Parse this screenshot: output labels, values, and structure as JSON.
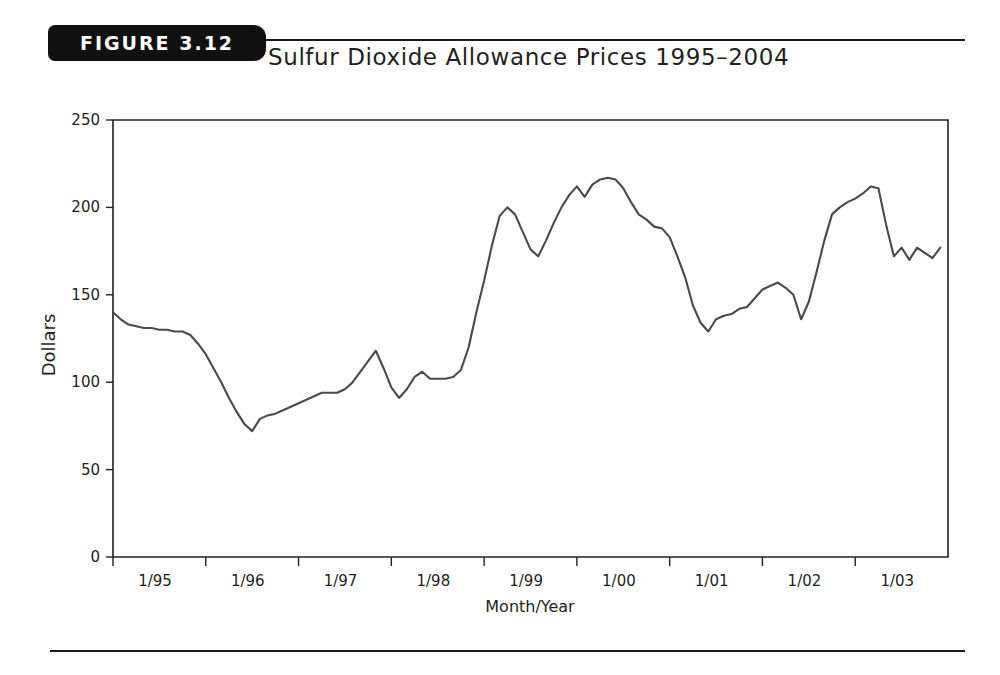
{
  "figure": {
    "badge_label": "FIGURE 3.12",
    "title": "Sulfur Dioxide Allowance Prices 1995–2004"
  },
  "colors": {
    "line": "#4a4a4a",
    "axis": "#231f20",
    "badge_background": "#111111",
    "badge_text": "#ffffff",
    "page_background": "#ffffff"
  },
  "chart_data": {
    "type": "line",
    "title": "Sulfur Dioxide Allowance Prices 1995–2004",
    "xlabel": "Month/Year",
    "ylabel": "Dollars",
    "xlim": [
      0,
      108
    ],
    "ylim": [
      0,
      250
    ],
    "grid": false,
    "legend": null,
    "yticks": [
      0,
      50,
      100,
      150,
      200,
      250
    ],
    "ytick_labels": [
      "0",
      "50",
      "100",
      "150",
      "200",
      "250"
    ],
    "xticks": [
      0,
      12,
      24,
      36,
      48,
      60,
      72,
      84,
      96
    ],
    "xtick_labels": [
      "1/95",
      "1/96",
      "1/97",
      "1/98",
      "1/99",
      "1/00",
      "1/01",
      "1/02",
      "1/03"
    ],
    "x": [
      0,
      1,
      2,
      3,
      4,
      5,
      6,
      7,
      8,
      9,
      10,
      11,
      12,
      13,
      14,
      15,
      16,
      17,
      18,
      19,
      20,
      21,
      22,
      23,
      24,
      25,
      26,
      27,
      28,
      29,
      30,
      31,
      32,
      33,
      34,
      35,
      36,
      37,
      38,
      39,
      40,
      41,
      42,
      43,
      44,
      45,
      46,
      47,
      48,
      49,
      50,
      51,
      52,
      53,
      54,
      55,
      56,
      57,
      58,
      59,
      60,
      61,
      62,
      63,
      64,
      65,
      66,
      67,
      68,
      69,
      70,
      71,
      72,
      73,
      74,
      75,
      76,
      77,
      78,
      79,
      80,
      81,
      82,
      83,
      84,
      85,
      86,
      87,
      88,
      89,
      90,
      91,
      92,
      93,
      94,
      95,
      96,
      97,
      98,
      99,
      100,
      101,
      102,
      103,
      104,
      105,
      106,
      107
    ],
    "values": [
      140,
      136,
      133,
      132,
      131,
      131,
      130,
      130,
      129,
      129,
      127,
      122,
      116,
      108,
      100,
      91,
      83,
      76,
      72,
      79,
      81,
      82,
      84,
      86,
      88,
      90,
      92,
      94,
      94,
      94,
      96,
      100,
      106,
      112,
      118,
      108,
      97,
      91,
      96,
      103,
      106,
      102,
      102,
      102,
      103,
      107,
      120,
      140,
      158,
      178,
      195,
      200,
      196,
      186,
      176,
      172,
      181,
      191,
      200,
      207,
      212,
      206,
      213,
      216,
      217,
      216,
      211,
      203,
      196,
      193,
      189,
      188,
      183,
      172,
      160,
      144,
      134,
      129,
      136,
      138,
      139,
      142,
      143,
      148,
      153,
      155,
      157,
      154,
      150,
      136,
      146,
      163,
      181,
      196,
      200,
      203,
      205,
      208,
      212,
      211,
      190,
      172,
      177,
      170,
      177,
      174,
      171,
      177
    ]
  },
  "series_note": {
    "start_value": 140,
    "minimum_value": 72,
    "maximum_value": 221,
    "end_value": 221
  }
}
